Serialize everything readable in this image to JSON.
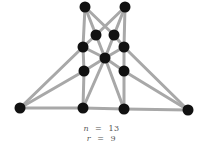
{
  "diagram": {
    "type": "graph",
    "nodes": [
      {
        "id": "t1",
        "x": 85,
        "y": 7
      },
      {
        "id": "t2",
        "x": 125,
        "y": 7
      },
      {
        "id": "u1",
        "x": 96,
        "y": 35
      },
      {
        "id": "u2",
        "x": 114,
        "y": 35
      },
      {
        "id": "m1",
        "x": 83,
        "y": 47
      },
      {
        "id": "m2",
        "x": 124,
        "y": 47
      },
      {
        "id": "c",
        "x": 105,
        "y": 58
      },
      {
        "id": "l1",
        "x": 84,
        "y": 71
      },
      {
        "id": "l2",
        "x": 124,
        "y": 71
      },
      {
        "id": "b0",
        "x": 20,
        "y": 108
      },
      {
        "id": "b1",
        "x": 83,
        "y": 108
      },
      {
        "id": "b2",
        "x": 124,
        "y": 109
      },
      {
        "id": "b3",
        "x": 188,
        "y": 110
      }
    ],
    "edges": [
      [
        "t1",
        "m1"
      ],
      [
        "t1",
        "u1"
      ],
      [
        "t1",
        "u2"
      ],
      [
        "t2",
        "m2"
      ],
      [
        "t2",
        "u2"
      ],
      [
        "t2",
        "u1"
      ],
      [
        "u1",
        "m1"
      ],
      [
        "u1",
        "c"
      ],
      [
        "u2",
        "m2"
      ],
      [
        "u2",
        "c"
      ],
      [
        "m1",
        "l1"
      ],
      [
        "m2",
        "l2"
      ],
      [
        "m1",
        "c"
      ],
      [
        "m2",
        "c"
      ],
      [
        "l1",
        "b1"
      ],
      [
        "l2",
        "b2"
      ],
      [
        "c",
        "l1"
      ],
      [
        "c",
        "l2"
      ],
      [
        "c",
        "b1"
      ],
      [
        "c",
        "b2"
      ],
      [
        "b0",
        "m1"
      ],
      [
        "b0",
        "l1"
      ],
      [
        "b0",
        "b1"
      ],
      [
        "b1",
        "b2"
      ],
      [
        "b2",
        "b3"
      ],
      [
        "b3",
        "m2"
      ],
      [
        "b3",
        "l2"
      ]
    ],
    "caption": {
      "n_label": "n",
      "n_value": "13",
      "r_label": "r",
      "r_value": "9"
    },
    "colors": {
      "edge": "#a8a8a8",
      "node": "#111111"
    }
  }
}
